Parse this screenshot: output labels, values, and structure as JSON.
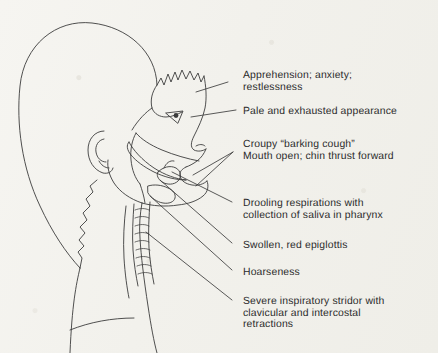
{
  "figure": {
    "style": "pen-and-ink line drawing on aged paper",
    "background_color": "#f2f1ec",
    "ink_color": "#3c3c3c",
    "text_color": "#2b2b2b",
    "width": 438,
    "height": 353
  },
  "labels": [
    {
      "id": "apprehension",
      "name": "label-apprehension",
      "text": "Apprehension; anxiety;\nrestlessness",
      "x": 243,
      "y": 70,
      "leader": {
        "x1": 228,
        "y1": 82,
        "x2": 196,
        "y2": 92
      }
    },
    {
      "id": "pale-exhausted",
      "name": "label-pale-exhausted-appearance",
      "text": "Pale and exhausted appearance",
      "x": 243,
      "y": 106,
      "leader": {
        "x1": 236,
        "y1": 110,
        "x2": 191,
        "y2": 117
      }
    },
    {
      "id": "croupy-cough",
      "name": "label-croupy-barking-cough",
      "text": "Croupy “barking cough”\nMouth open; chin thrust forward",
      "x": 243,
      "y": 139,
      "leader": {
        "x1": 233,
        "y1": 152,
        "x2": 193,
        "y2": 175
      }
    },
    {
      "id": "drooling",
      "name": "label-drooling-respirations",
      "text": "Drooling respirations with\ncollection of saliva in pharynx",
      "x": 243,
      "y": 198,
      "leader": {
        "x1": 232,
        "y1": 202,
        "x2": 172,
        "y2": 172
      }
    },
    {
      "id": "epiglottis",
      "name": "label-swollen-red-epiglottis",
      "text": "Swollen, red epiglottis",
      "x": 243,
      "y": 240,
      "leader": {
        "x1": 232,
        "y1": 243,
        "x2": 160,
        "y2": 180
      }
    },
    {
      "id": "hoarseness",
      "name": "label-hoarseness",
      "text": "Hoarseness",
      "x": 243,
      "y": 267,
      "leader": {
        "x1": 232,
        "y1": 270,
        "x2": 150,
        "y2": 196
      }
    },
    {
      "id": "stridor",
      "name": "label-severe-inspiratory-stridor",
      "text": "Severe inspiratory stridor with\nclavicular and intercostal\nretractions",
      "x": 243,
      "y": 296,
      "leader": {
        "x1": 232,
        "y1": 300,
        "x2": 146,
        "y2": 232
      }
    }
  ],
  "anatomy_parts": [
    {
      "name": "cranium-outline"
    },
    {
      "name": "hairline-zigzag"
    },
    {
      "name": "forehead-and-brow"
    },
    {
      "name": "eye"
    },
    {
      "name": "nose"
    },
    {
      "name": "open-mouth-lips"
    },
    {
      "name": "chin-and-jaw"
    },
    {
      "name": "ear"
    },
    {
      "name": "occipital-hairline"
    },
    {
      "name": "neck-back-contour"
    },
    {
      "name": "tongue"
    },
    {
      "name": "hard-and-soft-palate"
    },
    {
      "name": "pharynx-cavity"
    },
    {
      "name": "epiglottis"
    },
    {
      "name": "larynx"
    },
    {
      "name": "trachea-rings"
    },
    {
      "name": "esophagus"
    },
    {
      "name": "shoulder-contour"
    }
  ]
}
